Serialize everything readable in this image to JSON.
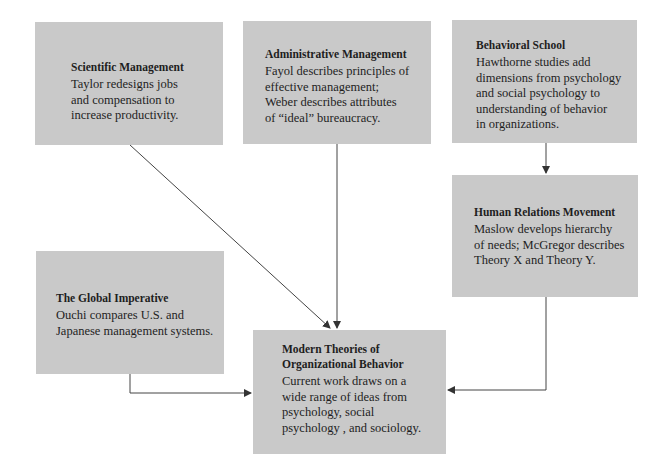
{
  "diagram": {
    "nodes": [
      {
        "id": "scientific",
        "title": "Scientific Management",
        "body": "Taylor redesigns jobs\nand compensation to\nincrease productivity."
      },
      {
        "id": "administrative",
        "title": "Administrative Management",
        "body": "Fayol describes principles of\neffective management;\nWeber describes attributes\nof “ideal” bureaucracy."
      },
      {
        "id": "behavioral",
        "title": "Behavioral School",
        "body": "Hawthorne studies add\ndimensions from psychology\nand social psychology to\nunderstanding of behavior\nin organizations."
      },
      {
        "id": "human-relations",
        "title": "Human Relations Movement",
        "body": "Maslow develops hierarchy\nof needs; McGregor describes\nTheory X and Theory Y."
      },
      {
        "id": "global",
        "title": "The Global Imperative",
        "body": "Ouchi compares U.S. and\nJapanese management systems."
      },
      {
        "id": "modern",
        "title": "Modern Theories of\nOrganizational Behavior",
        "body": "Current work draws on a\nwide range of ideas from\npsychology, social\npsychology , and sociology."
      }
    ],
    "edges": [
      {
        "from": "scientific",
        "to": "modern"
      },
      {
        "from": "administrative",
        "to": "modern"
      },
      {
        "from": "behavioral",
        "to": "human-relations"
      },
      {
        "from": "human-relations",
        "to": "modern"
      },
      {
        "from": "global",
        "to": "modern"
      }
    ],
    "colors": {
      "box_fill": "#c9c9c9",
      "text": "#1e1e1e",
      "arrow": "#333333",
      "background": "#ffffff"
    }
  }
}
